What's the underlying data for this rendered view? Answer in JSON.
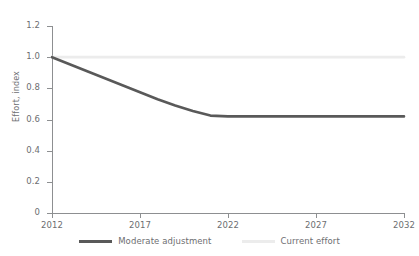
{
  "chart_data": {
    "type": "line",
    "title": "",
    "subtitle": "",
    "xlabel": "",
    "ylabel": "Effort, index",
    "xlim": [
      2012,
      2032
    ],
    "ylim": [
      0,
      1.2
    ],
    "grid": false,
    "legend_position": "bottom",
    "x_ticks": [
      "2012",
      "2017",
      "2022",
      "2027",
      "2032"
    ],
    "x_tick_values": [
      2012,
      2017,
      2022,
      2027,
      2032
    ],
    "y_ticks": [
      "0",
      "0.2",
      "0.4",
      "0.6",
      "0.8",
      "1.0",
      "1.2"
    ],
    "y_tick_values": [
      0,
      0.2,
      0.4,
      0.6,
      0.8,
      1.0,
      1.2
    ],
    "x": [
      2012,
      2013,
      2014,
      2015,
      2016,
      2017,
      2018,
      2019,
      2020,
      2021,
      2022,
      2023,
      2024,
      2025,
      2026,
      2027,
      2028,
      2029,
      2030,
      2031,
      2032
    ],
    "series": [
      {
        "name": "Moderate adjustment",
        "color": "#595959",
        "values": [
          1.0,
          0.955,
          0.91,
          0.865,
          0.82,
          0.775,
          0.73,
          0.69,
          0.655,
          0.625,
          0.62,
          0.62,
          0.62,
          0.62,
          0.62,
          0.62,
          0.62,
          0.62,
          0.62,
          0.62,
          0.62
        ]
      },
      {
        "name": "Current effort",
        "color": "#ececec",
        "values": [
          1.0,
          1.0,
          1.0,
          1.0,
          1.0,
          1.0,
          1.0,
          1.0,
          1.0,
          1.0,
          1.0,
          1.0,
          1.0,
          1.0,
          1.0,
          1.0,
          1.0,
          1.0,
          1.0,
          1.0,
          1.0
        ]
      }
    ]
  },
  "legend": {
    "items": [
      {
        "label": "Moderate adjustment",
        "color": "#595959"
      },
      {
        "label": "Current effort",
        "color": "#ececec"
      }
    ]
  },
  "axis_colors": {
    "axis_line": "#8d8f91",
    "tick_text": "#6d6e71"
  }
}
